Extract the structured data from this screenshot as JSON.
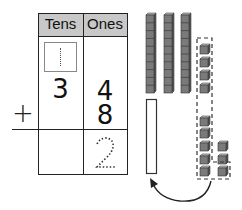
{
  "place_value_chart": {
    "headers": [
      "Tens",
      "Ones"
    ],
    "rows": [
      {
        "tens": "",
        "ones": "",
        "tens_regroup_box": "1"
      },
      {
        "tens": "3",
        "ones": "4"
      },
      {
        "operator": "+",
        "tens": "",
        "ones": "8"
      },
      {
        "tens": "",
        "ones": "2",
        "ones_style": "dotted-trace"
      }
    ],
    "regroup_box_hint": "dotted 1"
  },
  "base_ten_blocks": {
    "ten_rods": 3,
    "loose_ones_column_1": 4,
    "loose_ones_column_2": 5,
    "loose_ones_column_3": 3,
    "grouped_ones_count": 10,
    "empty_rod_outline": 1,
    "arrow": "curved arrow from grouped ones to empty ten-rod"
  },
  "colors": {
    "header_bg": "#c8c8c8",
    "cube_fill": "#7a7a7a",
    "line": "#222222"
  }
}
